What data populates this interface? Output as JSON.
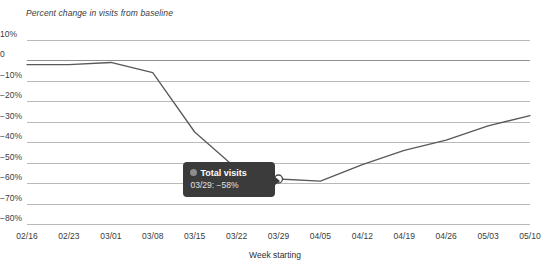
{
  "chart_data": {
    "type": "line",
    "title": "Percent change in visits from baseline",
    "xlabel": "Week starting",
    "ylabel": "",
    "grid": true,
    "legend_position": "none",
    "ylim": [
      -80,
      10
    ],
    "ytick_labels": [
      "10%",
      "0",
      "−10%",
      "−20%",
      "−30%",
      "−40%",
      "−50%",
      "−60%",
      "−70%",
      "−80%"
    ],
    "ytick_values": [
      10,
      0,
      -10,
      -20,
      -30,
      -40,
      -50,
      -60,
      -70,
      -80
    ],
    "categories": [
      "02/16",
      "02/23",
      "03/01",
      "03/08",
      "03/15",
      "03/22",
      "03/29",
      "04/05",
      "04/12",
      "04/19",
      "04/26",
      "05/03",
      "05/10"
    ],
    "series": [
      {
        "name": "Total visits",
        "color": "#595959",
        "values": [
          -2,
          -2,
          -1,
          -6,
          -35,
          -53,
          -58,
          -59,
          -51,
          -44,
          -39,
          -32,
          -27
        ]
      }
    ],
    "highlight": {
      "category": "03/29",
      "series_name": "Total visits",
      "value": -58,
      "marker_style": "open-circle"
    }
  },
  "tooltip": {
    "series_name": "Total visits",
    "value_text": "03/29: −58%",
    "swatch_color": "#8d8d8d",
    "background": "#3b3b3b"
  },
  "colors": {
    "line": "#595959",
    "gridline": "#b9b9b9",
    "baseline": "#8f8f8f",
    "text": "#3c3c3c",
    "background": "#ffffff"
  }
}
